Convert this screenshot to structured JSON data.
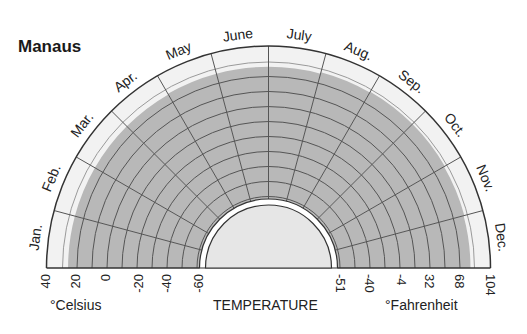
{
  "title": "Manaus",
  "colors": {
    "shade": "#b8b8b8",
    "outer_band": "#f2f2f2",
    "inner_disk": "#e6e6e6",
    "line": "#555555",
    "outline": "#333333"
  },
  "axis": {
    "center_label": "TEMPERATURE",
    "celsius_label": "°Celsius",
    "fahrenheit_label": "°Fahrenheit",
    "celsius_ticks": [
      "40",
      "20",
      "0",
      "-20",
      "-40",
      "-60"
    ],
    "fahrenheit_ticks": [
      "-51",
      "-40",
      "-4",
      "32",
      "68",
      "104"
    ]
  },
  "months": [
    "Jan.",
    "Feb.",
    "Mar.",
    "Apr.",
    "May",
    "June",
    "July",
    "Aug.",
    "Sep.",
    "Oct.",
    "Nov.",
    "Dec."
  ],
  "chart_data": {
    "type": "radial-bar",
    "title": "Manaus",
    "categories": [
      "Jan.",
      "Feb.",
      "Mar.",
      "Apr.",
      "May",
      "June",
      "July",
      "Aug.",
      "Sep.",
      "Oct.",
      "Nov.",
      "Dec."
    ],
    "series": [
      {
        "name": "Mean temperature (°C)",
        "values": [
          26,
          26,
          26,
          26,
          26.5,
          26.5,
          26.5,
          27.5,
          28,
          28,
          27.5,
          27
        ]
      }
    ],
    "xlabel": "TEMPERATURE",
    "left_axis_label": "°Celsius",
    "right_axis_label": "°Fahrenheit",
    "celsius_ticks": [
      40,
      20,
      0,
      -20,
      -40,
      -60
    ],
    "fahrenheit_ticks": [
      -51,
      -40,
      -4,
      32,
      68,
      104
    ],
    "radial_range_celsius": [
      -60,
      40
    ],
    "grid": true
  }
}
